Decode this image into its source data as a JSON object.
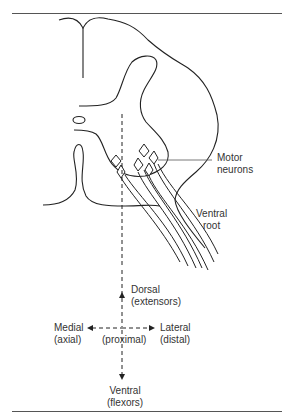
{
  "figure": {
    "colors": {
      "line": "#222222",
      "text": "#333333",
      "rule": "#555555"
    }
  },
  "labels": {
    "motor_neurons": [
      "Motor",
      "neurons"
    ],
    "ventral_root": [
      "Ventral",
      "root"
    ],
    "dorsal": [
      "Dorsal",
      "(extensors)"
    ],
    "medial": [
      "Medial",
      "(axial)"
    ],
    "proximal": "(proximal)",
    "lateral": [
      "Lateral",
      "(distal)"
    ],
    "ventral": [
      "Ventral",
      "(flexors)"
    ]
  }
}
